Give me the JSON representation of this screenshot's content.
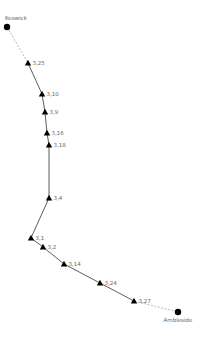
{
  "map": {
    "colors": {
      "route_solid": "#333333",
      "route_dashed": "#999999",
      "marker": "#000000",
      "label": "#666666",
      "background": "#ffffff"
    },
    "endpoints": [
      {
        "name": "Keswick",
        "x": 7,
        "y": 27,
        "label_x": 5,
        "label_y": 20,
        "anchor": "start"
      },
      {
        "name": "Ambleside",
        "x": 178,
        "y": 312,
        "label_x": 178,
        "label_y": 322,
        "anchor": "middle"
      }
    ],
    "waypoints": [
      {
        "label": "3,25",
        "x": 28,
        "y": 63
      },
      {
        "label": "3,10",
        "x": 42,
        "y": 94
      },
      {
        "label": "3,9",
        "x": 45,
        "y": 112
      },
      {
        "label": "3,16",
        "x": 47,
        "y": 133
      },
      {
        "label": "3,18",
        "x": 49,
        "y": 145
      },
      {
        "label": "3,4",
        "x": 49,
        "y": 198
      },
      {
        "label": "3,1",
        "x": 31,
        "y": 238
      },
      {
        "label": "3,2",
        "x": 43,
        "y": 247
      },
      {
        "label": "3,14",
        "x": 64,
        "y": 264
      },
      {
        "label": "3,24",
        "x": 100,
        "y": 283
      },
      {
        "label": "3,27",
        "x": 134,
        "y": 301
      }
    ]
  }
}
